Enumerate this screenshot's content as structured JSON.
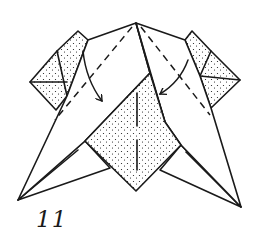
{
  "diagram": {
    "type": "origami-step",
    "step_number": "11",
    "colors": {
      "line": "#1a1a1a",
      "paper_white": "#ffffff",
      "paper_colored_stipple": "#1a1a1a"
    },
    "elements": {
      "fold_arrows": 2,
      "valley_fold_lines": 2,
      "stippled_regions": [
        "left-ear-flap",
        "right-ear-flap",
        "center-diamond"
      ]
    }
  }
}
